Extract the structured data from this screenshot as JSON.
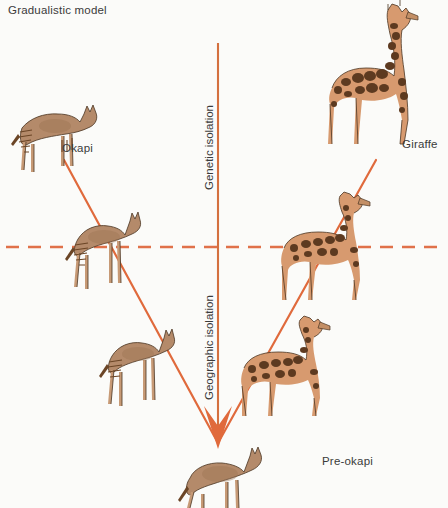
{
  "figure": {
    "title": "Gradualistic model",
    "type": "diagram"
  },
  "axes": {
    "vertical_line_color": "#d4703f",
    "upper_label": "Genetic isolation",
    "lower_label": "Geographic isolation",
    "divider": {
      "style": "dashed",
      "color": "#e0714a",
      "orientation": "horizontal"
    }
  },
  "labels": {
    "okapi": "Okapi",
    "giraffe": "Giraffe",
    "pre_okapi": "Pre-okapi"
  },
  "lineages": [
    {
      "name": "okapi-lineage",
      "direction": "upper-left",
      "stages": [
        {
          "id": "pre-okapi",
          "label": "Pre-okapi",
          "stage": 1
        },
        {
          "id": "okapi-stage-2",
          "label": "",
          "stage": 2
        },
        {
          "id": "okapi-stage-3",
          "label": "",
          "stage": 3
        },
        {
          "id": "okapi-final",
          "label": "Okapi",
          "stage": 4
        }
      ]
    },
    {
      "name": "giraffe-lineage",
      "direction": "upper-right",
      "stages": [
        {
          "id": "pre-okapi",
          "label": "Pre-okapi",
          "stage": 1
        },
        {
          "id": "giraffe-stage-2",
          "label": "",
          "stage": 2
        },
        {
          "id": "giraffe-stage-3",
          "label": "",
          "stage": 3
        },
        {
          "id": "giraffe-final",
          "label": "Giraffe",
          "stage": 4
        }
      ]
    }
  ],
  "colors": {
    "accent": "#e06a3c",
    "axis": "#d4703f",
    "text": "#3a3a3a",
    "background": "#fbfbf9",
    "okapi_body": "#b48a6a",
    "giraffe_body": "#d79a6f"
  }
}
